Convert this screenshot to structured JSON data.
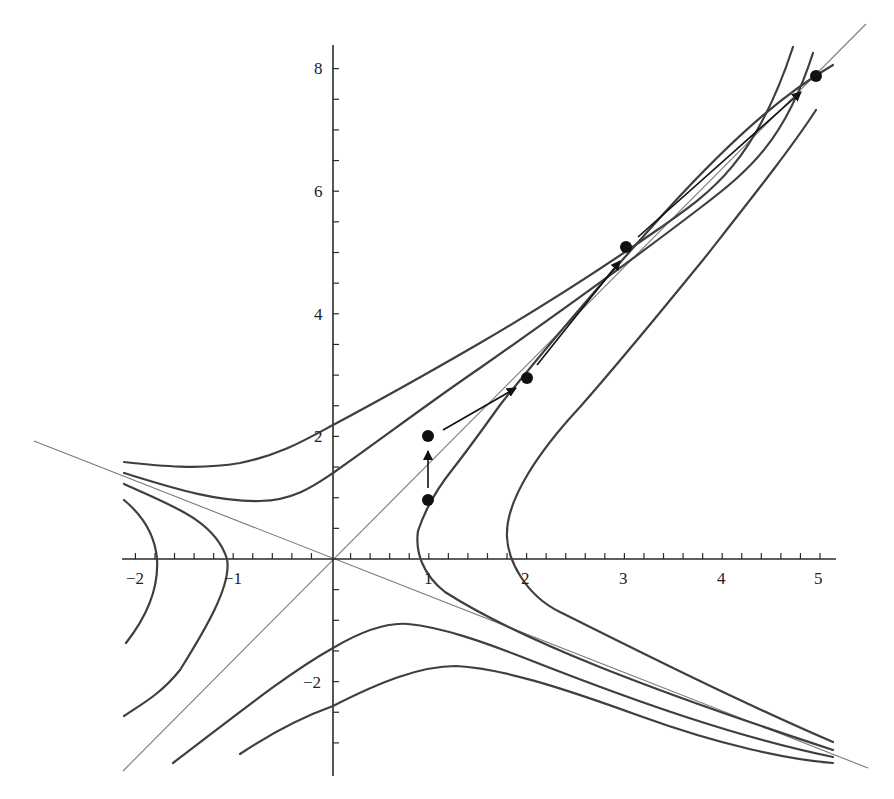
{
  "chart_data": {
    "type": "line",
    "title": "",
    "xlabel": "",
    "ylabel": "",
    "xlim": [
      -2.2,
      5.1
    ],
    "ylim": [
      -3.5,
      8.3
    ],
    "grid": false,
    "x_ticks": [
      "-2",
      "-1",
      "1",
      "2",
      "3",
      "4",
      "5"
    ],
    "y_ticks": [
      "-2",
      "2",
      "4",
      "6",
      "8"
    ],
    "asymptotes": [
      {
        "name": "y = φx",
        "slope": 1.618
      },
      {
        "name": "y = -x/φ",
        "slope": -0.618
      }
    ],
    "hyperbola_levels": [
      "inner",
      "outer"
    ],
    "points": [
      {
        "x": 1,
        "y": 1
      },
      {
        "x": 1,
        "y": 2
      },
      {
        "x": 2,
        "y": 3
      },
      {
        "x": 3,
        "y": 5
      },
      {
        "x": 5,
        "y": 8
      }
    ],
    "arrows": [
      {
        "from": [
          1,
          1
        ],
        "to": [
          1,
          2
        ]
      },
      {
        "from": [
          1,
          2
        ],
        "to": [
          2,
          3
        ]
      },
      {
        "from": [
          2,
          3
        ],
        "to": [
          3,
          5
        ]
      },
      {
        "from": [
          3,
          5
        ],
        "to": [
          5,
          8
        ]
      }
    ]
  },
  "labels": {
    "x": {
      "m2": "−2",
      "m1": "−1",
      "p1": "1",
      "p2": "2",
      "p3": "3",
      "p4": "4",
      "p5": "5"
    },
    "y": {
      "m2": "−2",
      "p2": "2",
      "p4": "4",
      "p6": "6",
      "p8": "8"
    }
  },
  "colors": {
    "curve": "#3f3f3f",
    "asymptote": "#7a7a7a",
    "point": "#111111"
  }
}
